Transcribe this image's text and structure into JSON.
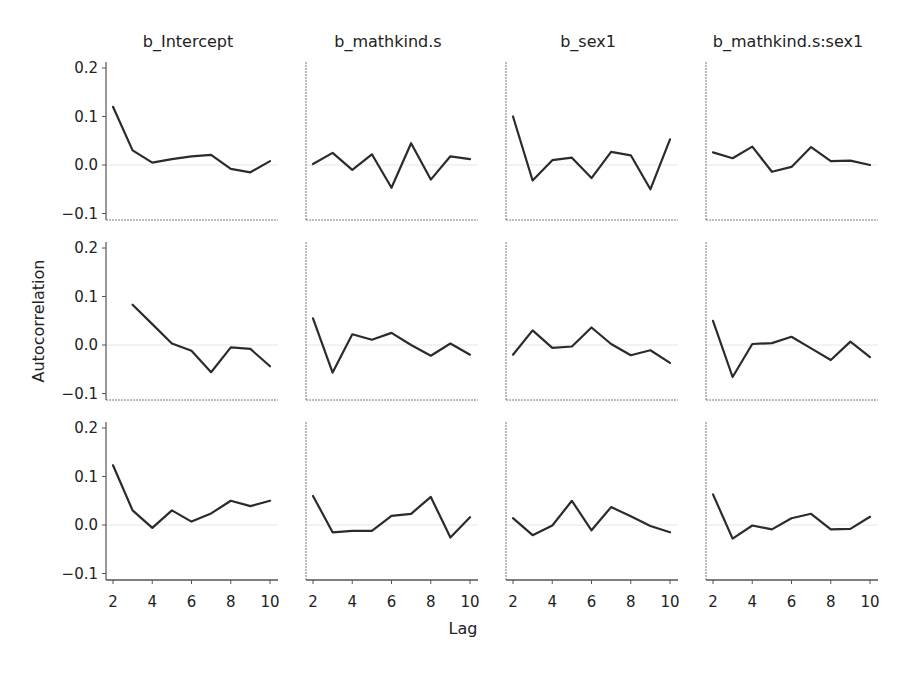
{
  "chart_data": {
    "type": "line",
    "title": "",
    "xlabel": "Lag",
    "ylabel": "Autocorrelation",
    "x": [
      2,
      3,
      4,
      5,
      6,
      7,
      8,
      9,
      10
    ],
    "xticks": [
      2,
      4,
      6,
      8,
      10
    ],
    "yticks": [
      -0.1,
      0.0,
      0.1,
      0.2
    ],
    "ytick_labels": [
      "−0.1",
      "0.0",
      "0.1",
      "0.2"
    ],
    "ylim": [
      -0.11,
      0.21
    ],
    "xlim": [
      1.8,
      10.2
    ],
    "grid": false,
    "zero_reference_line": true,
    "legend": null,
    "columns": [
      "b_Intercept",
      "b_mathkind.s",
      "b_sex1",
      "b_mathkind.s:sex1"
    ],
    "rows": [
      "chain 1",
      "chain 2",
      "chain 3"
    ],
    "panels": [
      [
        {
          "parameter": "b_Intercept",
          "x": [
            2,
            3,
            4,
            5,
            6,
            7,
            8,
            9,
            10
          ],
          "values": [
            0.12,
            0.03,
            0.005,
            0.012,
            0.018,
            0.021,
            -0.008,
            -0.015,
            0.008
          ]
        },
        {
          "parameter": "b_mathkind.s",
          "x": [
            2,
            3,
            4,
            5,
            6,
            7,
            8,
            9,
            10
          ],
          "values": [
            0.002,
            0.025,
            -0.01,
            0.022,
            -0.047,
            0.045,
            -0.03,
            0.018,
            0.012
          ]
        },
        {
          "parameter": "b_sex1",
          "x": [
            2,
            3,
            4,
            5,
            6,
            7,
            8,
            9,
            10
          ],
          "values": [
            0.1,
            -0.032,
            0.01,
            0.015,
            -0.027,
            0.027,
            0.02,
            -0.05,
            0.053
          ]
        },
        {
          "parameter": "b_mathkind.s:sex1",
          "x": [
            2,
            3,
            4,
            5,
            6,
            7,
            8,
            9,
            10
          ],
          "values": [
            0.026,
            0.014,
            0.038,
            -0.014,
            -0.004,
            0.037,
            0.008,
            0.009,
            0.0
          ]
        }
      ],
      [
        {
          "parameter": "b_Intercept",
          "x": [
            3,
            4,
            5,
            6,
            7,
            8,
            9,
            10
          ],
          "values": [
            0.083,
            0.043,
            0.003,
            -0.012,
            -0.056,
            -0.005,
            -0.008,
            -0.044
          ]
        },
        {
          "parameter": "b_mathkind.s",
          "x": [
            2,
            3,
            4,
            5,
            6,
            7,
            8,
            9,
            10
          ],
          "values": [
            0.055,
            -0.057,
            0.022,
            0.011,
            0.025,
            0.0,
            -0.022,
            0.003,
            -0.02
          ]
        },
        {
          "parameter": "b_sex1",
          "x": [
            2,
            3,
            4,
            5,
            6,
            7,
            8,
            9,
            10
          ],
          "values": [
            -0.02,
            0.03,
            -0.006,
            -0.003,
            0.036,
            0.002,
            -0.021,
            -0.011,
            -0.037
          ]
        },
        {
          "parameter": "b_mathkind.s:sex1",
          "x": [
            2,
            3,
            4,
            5,
            6,
            7,
            8,
            9,
            10
          ],
          "values": [
            0.05,
            -0.066,
            0.002,
            0.004,
            0.017,
            -0.007,
            -0.031,
            0.007,
            -0.025
          ]
        }
      ],
      [
        {
          "parameter": "b_Intercept",
          "x": [
            2,
            3,
            4,
            5,
            6,
            7,
            8,
            9,
            10
          ],
          "values": [
            0.123,
            0.03,
            -0.006,
            0.03,
            0.007,
            0.024,
            0.05,
            0.039,
            0.05
          ]
        },
        {
          "parameter": "b_mathkind.s",
          "x": [
            2,
            3,
            4,
            5,
            6,
            7,
            8,
            9,
            10
          ],
          "values": [
            0.06,
            -0.015,
            -0.012,
            -0.012,
            0.019,
            0.023,
            0.058,
            -0.026,
            0.016
          ]
        },
        {
          "parameter": "b_sex1",
          "x": [
            2,
            3,
            4,
            5,
            6,
            7,
            8,
            9,
            10
          ],
          "values": [
            0.014,
            -0.021,
            -0.001,
            0.05,
            -0.011,
            0.037,
            0.018,
            -0.002,
            -0.015
          ]
        },
        {
          "parameter": "b_mathkind.s:sex1",
          "x": [
            2,
            3,
            4,
            5,
            6,
            7,
            8,
            9,
            10
          ],
          "values": [
            0.063,
            -0.028,
            -0.001,
            -0.009,
            0.014,
            0.023,
            -0.009,
            -0.008,
            0.017
          ]
        }
      ]
    ]
  },
  "colors": {
    "line": "#2b2b2b",
    "axis": "#555555",
    "zero_line": "#e6e6e6",
    "text": "#222222",
    "background": "#ffffff"
  }
}
